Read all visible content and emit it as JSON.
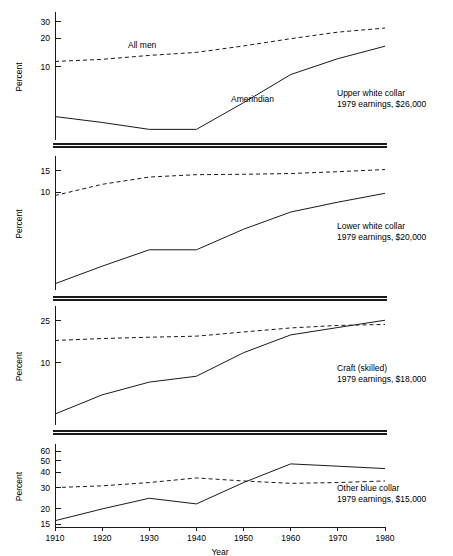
{
  "figure": {
    "xlabel": "Year",
    "ylabel": "Percent",
    "x_ticks": [
      1910,
      1920,
      1930,
      1940,
      1950,
      1960,
      1970,
      1980
    ],
    "series_labels": {
      "dashed": "All men",
      "solid": "Amerindian"
    },
    "scale": "log",
    "background": "#ffffff",
    "line_color": "#1a1a1a"
  },
  "chart_data": {
    "type": "line",
    "title": "",
    "xlabel": "Year",
    "ylabel": "Percent",
    "scale": "log",
    "grid": false,
    "legend": "inline-annotation",
    "x": [
      1910,
      1920,
      1930,
      1940,
      1950,
      1960,
      1970,
      1980
    ],
    "xlim": [
      1910,
      1980
    ],
    "panels": [
      {
        "name": "upper-white-collar",
        "annotation_line1": "Upper white collar",
        "annotation_line2": "1979 earnings, $26,000",
        "y_ticks": [
          10,
          20,
          30
        ],
        "ylim": [
          1.7,
          36
        ],
        "series": [
          {
            "name": "All men",
            "style": "dashed",
            "values": [
              11.4,
              12.0,
              13.2,
              14.2,
              16.6,
              19.8,
              23.2,
              25.6
            ]
          },
          {
            "name": "Amerindian",
            "style": "solid",
            "values": [
              3.0,
              2.6,
              2.2,
              2.2,
              4.2,
              8.3,
              12.2,
              16.5
            ]
          }
        ]
      },
      {
        "name": "lower-white-collar",
        "annotation_line1": "Lower white collar",
        "annotation_line2": "1979 earnings, $20,000",
        "y_ticks": [
          10,
          15
        ],
        "ylim": [
          1.6,
          19
        ],
        "series": [
          {
            "name": "All men",
            "style": "dashed",
            "values": [
              9.4,
              11.6,
              13.3,
              13.9,
              14.0,
              14.2,
              14.7,
              15.3
            ]
          },
          {
            "name": "Amerindian",
            "style": "solid",
            "values": [
              1.8,
              2.5,
              3.4,
              3.4,
              5.0,
              6.9,
              8.3,
              9.8
            ]
          }
        ]
      },
      {
        "name": "craft-skilled",
        "annotation_line1": "Craft (skilled)",
        "annotation_line2": "1979 earnings, $18,000",
        "y_ticks": [
          10,
          25
        ],
        "ylim": [
          2.6,
          33
        ],
        "series": [
          {
            "name": "All men",
            "style": "dashed",
            "values": [
              16.3,
              17.0,
              17.5,
              17.9,
              19.6,
              21.4,
              22.6,
              23.1
            ]
          },
          {
            "name": "Amerindian",
            "style": "solid",
            "values": [
              3.3,
              5.0,
              6.6,
              7.5,
              12.5,
              18.4,
              21.6,
              25.3
            ]
          }
        ]
      },
      {
        "name": "other-blue-collar",
        "annotation_line1": "Other blue collar",
        "annotation_line2": "1979 earnings, $15,000",
        "y_ticks": [
          15,
          20,
          30,
          40,
          50,
          60
        ],
        "ylim": [
          14.2,
          66
        ],
        "series": [
          {
            "name": "All men",
            "style": "dashed",
            "values": [
              30.0,
              31.0,
              33.0,
              36.0,
              34.0,
              32.5,
              33.0,
              34.0
            ]
          },
          {
            "name": "Amerindian",
            "style": "solid",
            "values": [
              16.0,
              20.0,
              24.5,
              22.0,
              33.0,
              47.0,
              45.0,
              43.0
            ]
          }
        ]
      }
    ]
  }
}
